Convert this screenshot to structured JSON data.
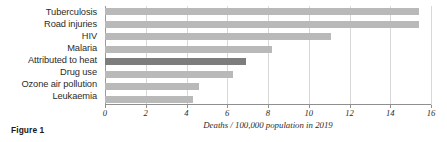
{
  "caption": "Figure 1",
  "chart_data": {
    "type": "bar",
    "orientation": "horizontal",
    "title": "",
    "xlabel": "Deaths / 100,000 population in 2019",
    "ylabel": "",
    "xlim": [
      0,
      16
    ],
    "xticks": [
      0,
      2,
      4,
      6,
      8,
      10,
      12,
      14,
      16
    ],
    "xtick_labels": [
      "0",
      "2",
      "4",
      "6",
      "8",
      "10",
      "12",
      "14",
      "16"
    ],
    "grid": true,
    "grid_axis": "x",
    "legend": null,
    "categories": [
      "Tuberculosis",
      "Road injuries",
      "HIV",
      "Malaria",
      "Attributed to heat",
      "Drug use",
      "Ozone air pollution",
      "Leukaemia"
    ],
    "values": [
      15.4,
      15.4,
      11.1,
      8.2,
      6.9,
      6.3,
      4.6,
      4.3
    ],
    "highlight_index": 4,
    "colors": {
      "bar": "#b9b9b9",
      "highlight_bar": "#7d7d7d",
      "gridline": "#d8d8d8",
      "axis": "#8f8f8f",
      "text": "#2b2b2b",
      "background": "#ffffff"
    }
  }
}
